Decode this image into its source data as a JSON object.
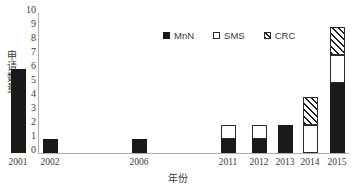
{
  "chart_data": {
    "type": "bar",
    "stacked": true,
    "title": "",
    "xlabel": "年份",
    "ylabel": "申请数量",
    "categories": [
      "2001",
      "2002",
      "2006",
      "2011",
      "2012",
      "2013",
      "2014",
      "2015"
    ],
    "series": [
      {
        "name": "MnN",
        "values": [
          6,
          1,
          1,
          1,
          1,
          2,
          0,
          5
        ],
        "style": "solid-black",
        "color": "#1a1a1a"
      },
      {
        "name": "SMS",
        "values": [
          0,
          0,
          0,
          1,
          1,
          0,
          2,
          2
        ],
        "style": "open-white",
        "color": "#ffffff"
      },
      {
        "name": "CRC",
        "values": [
          0,
          0,
          0,
          0,
          0,
          0,
          2,
          2
        ],
        "style": "diagonal-hatch",
        "color": "#1d1d1d"
      }
    ],
    "totals": [
      6,
      1,
      1,
      2,
      2,
      2,
      4,
      9
    ],
    "ylim": [
      0,
      10
    ],
    "ytick_step": 1,
    "yticks": [
      "10",
      "9",
      "8",
      "7",
      "6",
      "5",
      "4",
      "3",
      "2",
      "1",
      "0"
    ],
    "grid": false,
    "legend_position": "top-center"
  },
  "legend": {
    "items": [
      {
        "label": "MnN",
        "swatch": "filled-square-icon"
      },
      {
        "label": "SMS",
        "swatch": "empty-square-icon"
      },
      {
        "label": "CRC",
        "swatch": "hatched-square-icon"
      }
    ]
  },
  "axes": {
    "y_title": "申请数量",
    "x_title": "年份"
  }
}
